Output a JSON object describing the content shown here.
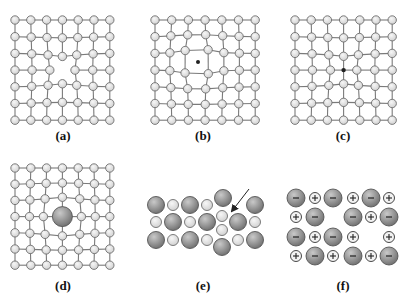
{
  "figure": {
    "colors": {
      "atom_fill_light": "#e2e2e2",
      "atom_stroke": "#6e6e6e",
      "bond": "#7a7a7a",
      "large_atom_fill": "#8e8e8e",
      "large_atom_highlight": "#c8c8c8",
      "dark_atom": "#222222",
      "arrow": "#222222",
      "label": "#111111"
    },
    "panels": [
      {
        "id": "a",
        "label": "(a)",
        "label_pos": [
          63,
          136
        ],
        "type": "lattice",
        "origin": [
          15,
          20
        ],
        "spacing": [
          15.8,
          16.7
        ],
        "rows": 7,
        "cols": 7,
        "atom_r": 4.2,
        "defect": {
          "kind": "vacancy",
          "row": 3,
          "col": 3,
          "strength": -3.2
        }
      },
      {
        "id": "b",
        "label": "(b)",
        "label_pos": [
          203,
          136
        ],
        "type": "lattice",
        "origin": [
          155,
          20
        ],
        "spacing": [
          16.7,
          16.7
        ],
        "rows": 7,
        "cols": 7,
        "atom_r": 4.2,
        "defect": {
          "kind": "interstitial",
          "x": 198,
          "y": 62,
          "r": 2.0,
          "strength": 3.5
        }
      },
      {
        "id": "c",
        "label": "(c)",
        "label_pos": [
          343,
          136
        ],
        "type": "lattice",
        "origin": [
          295,
          20
        ],
        "spacing": [
          16.2,
          16.7
        ],
        "rows": 7,
        "cols": 7,
        "atom_r": 4.2,
        "defect": {
          "kind": "small-substitutional",
          "row": 3,
          "col": 3,
          "r": 2.2,
          "strength": -3.0
        }
      },
      {
        "id": "d",
        "label": "(d)",
        "label_pos": [
          63,
          285
        ],
        "type": "lattice",
        "origin": [
          15,
          168
        ],
        "spacing": [
          15.8,
          16.2
        ],
        "rows": 7,
        "cols": 7,
        "atom_r": 4.2,
        "defect": {
          "kind": "large-substitutional",
          "row": 3,
          "col": 3,
          "r": 10,
          "strength": 3.2
        }
      },
      {
        "id": "e",
        "label": "(e)",
        "label_pos": [
          203,
          285
        ],
        "type": "ionic-frenkel",
        "large_r": 8.5,
        "small_r": 5.5,
        "atoms": [
          {
            "x": 156,
            "y": 205,
            "size": "large"
          },
          {
            "x": 173,
            "y": 205,
            "size": "small"
          },
          {
            "x": 190,
            "y": 205,
            "size": "large"
          },
          {
            "x": 207,
            "y": 205,
            "size": "small"
          },
          {
            "x": 223,
            "y": 198,
            "size": "large"
          },
          {
            "x": 255,
            "y": 205,
            "size": "large"
          },
          {
            "x": 156,
            "y": 222,
            "size": "small"
          },
          {
            "x": 173,
            "y": 222,
            "size": "large"
          },
          {
            "x": 190,
            "y": 222,
            "size": "small"
          },
          {
            "x": 207,
            "y": 222,
            "size": "large"
          },
          {
            "x": 222,
            "y": 216,
            "size": "small"
          },
          {
            "x": 222,
            "y": 230,
            "size": "small"
          },
          {
            "x": 238,
            "y": 222,
            "size": "large"
          },
          {
            "x": 255,
            "y": 222,
            "size": "small"
          },
          {
            "x": 156,
            "y": 240,
            "size": "large"
          },
          {
            "x": 173,
            "y": 240,
            "size": "small"
          },
          {
            "x": 190,
            "y": 240,
            "size": "large"
          },
          {
            "x": 207,
            "y": 240,
            "size": "small"
          },
          {
            "x": 222,
            "y": 247,
            "size": "large"
          },
          {
            "x": 238,
            "y": 240,
            "size": "small"
          },
          {
            "x": 255,
            "y": 240,
            "size": "large"
          }
        ],
        "arrow": {
          "from": [
            249,
            189
          ],
          "to": [
            232,
            211
          ]
        }
      },
      {
        "id": "f",
        "label": "(f)",
        "label_pos": [
          343,
          285
        ],
        "type": "ionic-schottky",
        "large_r": 9,
        "small_r": 5.5,
        "ions": [
          {
            "x": 296,
            "y": 198,
            "charge": "-"
          },
          {
            "x": 315,
            "y": 198,
            "charge": "+"
          },
          {
            "x": 333,
            "y": 198,
            "charge": "-"
          },
          {
            "x": 353,
            "y": 198,
            "charge": "+"
          },
          {
            "x": 371,
            "y": 198,
            "charge": "-"
          },
          {
            "x": 389,
            "y": 198,
            "charge": "+"
          },
          {
            "x": 296,
            "y": 217,
            "charge": "+"
          },
          {
            "x": 315,
            "y": 217,
            "charge": "-"
          },
          {
            "x": 353,
            "y": 217,
            "charge": "-"
          },
          {
            "x": 371,
            "y": 217,
            "charge": "+"
          },
          {
            "x": 389,
            "y": 217,
            "charge": "-"
          },
          {
            "x": 296,
            "y": 237,
            "charge": "-"
          },
          {
            "x": 315,
            "y": 237,
            "charge": "+"
          },
          {
            "x": 333,
            "y": 237,
            "charge": "-"
          },
          {
            "x": 353,
            "y": 237,
            "charge": "+"
          },
          {
            "x": 389,
            "y": 237,
            "charge": "+"
          },
          {
            "x": 296,
            "y": 256,
            "charge": "+"
          },
          {
            "x": 315,
            "y": 256,
            "charge": "-"
          },
          {
            "x": 333,
            "y": 256,
            "charge": "+"
          },
          {
            "x": 353,
            "y": 256,
            "charge": "-"
          },
          {
            "x": 371,
            "y": 256,
            "charge": "+"
          },
          {
            "x": 389,
            "y": 256,
            "charge": "-"
          }
        ]
      }
    ]
  }
}
